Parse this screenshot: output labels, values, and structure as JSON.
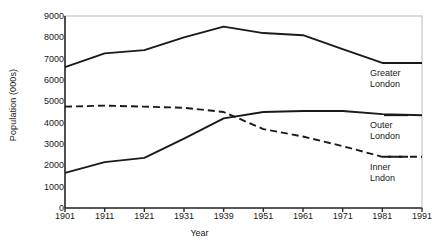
{
  "chart_data": {
    "type": "line",
    "title": "",
    "xlabel": "Year",
    "ylabel": "Population (000s)",
    "x": [
      1901,
      1911,
      1921,
      1931,
      1939,
      1951,
      1961,
      1971,
      1981,
      1991
    ],
    "xtick_labels": [
      "1901",
      "1911",
      "1921",
      "1931",
      "1939",
      "1951",
      "1961",
      "1971",
      "1981",
      "1991"
    ],
    "ytick_labels": [
      "9000",
      "8000",
      "7000",
      "6000",
      "5000",
      "4000",
      "3000",
      "2000",
      "1000",
      "0"
    ],
    "ytick_values": [
      9000,
      8000,
      7000,
      6000,
      5000,
      4000,
      3000,
      2000,
      1000,
      0
    ],
    "ylim": [
      0,
      9000
    ],
    "xlim": [
      1901,
      1991
    ],
    "grid": false,
    "legend_position": "right-inline",
    "series": [
      {
        "name": "Greater London",
        "label": "Greater\nLondon",
        "style": "solid",
        "color": "#1a1a1a",
        "values": [
          6600,
          7250,
          7400,
          8000,
          8500,
          8200,
          8100,
          7450,
          6800,
          6800
        ]
      },
      {
        "name": "Outer London",
        "label": "Outer\nLondon",
        "style": "solid",
        "color": "#1a1a1a",
        "values": [
          1650,
          2150,
          2350,
          3250,
          4200,
          4500,
          4550,
          4550,
          4400,
          4350
        ]
      },
      {
        "name": "Inner Lndon",
        "label": "Inner\nLndon",
        "style": "dashed",
        "color": "#1a1a1a",
        "values": [
          4750,
          4800,
          4750,
          4700,
          4500,
          3700,
          3350,
          2900,
          2400,
          2400
        ]
      }
    ]
  },
  "plot_geometry": {
    "left": 65,
    "right": 422,
    "top": 16,
    "bottom": 208
  }
}
